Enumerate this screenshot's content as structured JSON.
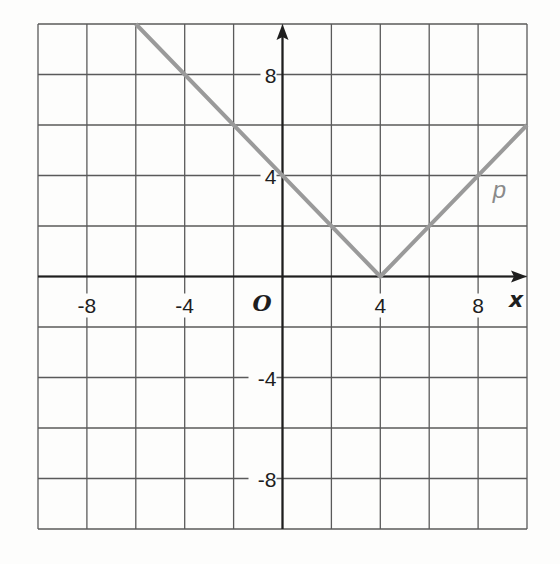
{
  "chart_data": {
    "type": "line",
    "title": "",
    "xlabel": "x",
    "ylabel": "",
    "origin_label": "O",
    "xlim": [
      -10,
      10
    ],
    "ylim": [
      -10,
      10
    ],
    "grid": true,
    "grid_step": 2,
    "x_ticks": [
      -8,
      -4,
      4,
      8
    ],
    "y_ticks": [
      8,
      4,
      -4,
      -8
    ],
    "x_tick_labels": [
      "-8",
      "-4",
      "4",
      "8"
    ],
    "y_tick_labels": [
      "8",
      "4",
      "-4",
      "-8"
    ],
    "series": [
      {
        "name": "p",
        "equation": "y = |x - 4|",
        "color": "#9a9a9a",
        "x": [
          -6,
          4,
          10
        ],
        "y": [
          10,
          0,
          6
        ]
      }
    ],
    "annotations": [
      {
        "text": "p",
        "x": 8.6,
        "y": 3.1
      }
    ]
  },
  "colors": {
    "grid": "#5a5a5a",
    "axis": "#1e1e1e",
    "curve": "#9a9a9a",
    "background": "#fdfdfc"
  }
}
